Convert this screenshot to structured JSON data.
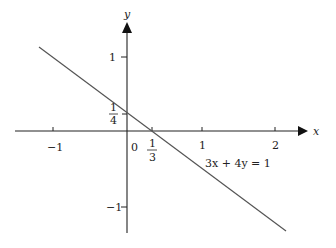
{
  "diagram": {
    "type": "coordinate-graph",
    "equation_label": "3x + 4y = 1",
    "axes": {
      "x_label": "x",
      "y_label": "y",
      "origin_label": "0",
      "x_ticks": [
        {
          "value": -1,
          "label": "−1"
        },
        {
          "value": 1,
          "label": "1"
        },
        {
          "value": 2,
          "label": "2"
        }
      ],
      "y_ticks": [
        {
          "value": 1,
          "label": "1"
        },
        {
          "value": -1,
          "label": "−1"
        }
      ]
    },
    "intercepts": {
      "x_intercept": {
        "num": "1",
        "den": "3"
      },
      "y_intercept": {
        "num": "1",
        "den": "4"
      }
    },
    "line": {
      "from": [
        -1.19,
        1.14
      ],
      "to": [
        2.15,
        -1.36
      ],
      "color": "#555555"
    },
    "colors": {
      "axis": "#222222",
      "line": "#555555",
      "background": "#ffffff"
    }
  }
}
